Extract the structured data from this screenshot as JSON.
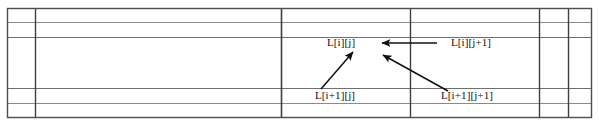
{
  "diagram": {
    "table": {
      "border_color": "#4d4d4d",
      "inner_line_color": "#808080",
      "bounds": {
        "x": 7,
        "y": 8,
        "width": 585,
        "height": 110
      },
      "vertical_lines": [
        7,
        35,
        281,
        410,
        539,
        568,
        592
      ],
      "horizontal_lines": [
        8,
        22,
        37,
        88,
        103,
        118
      ],
      "columns": 6,
      "rows": 5
    },
    "labels": [
      {
        "id": "l-i-j",
        "text": "L[i][j]",
        "x": 327,
        "y": 36
      },
      {
        "id": "l-i-j-plus-1",
        "text": "L[i][j+1]",
        "x": 451,
        "y": 36
      },
      {
        "id": "l-i-plus-1-j",
        "text": "L[i+1][j]",
        "x": 315,
        "y": 89
      },
      {
        "id": "l-i-plus-1-j-plus-1",
        "text": "L[i+1][j+1]",
        "x": 441,
        "y": 89
      }
    ],
    "arrows": [
      {
        "id": "arrow-right-to-left",
        "from_label": "L[i][j+1]",
        "to_label": "L[i][j]",
        "direction": "left",
        "x1": 437,
        "y1": 43,
        "x2": 381,
        "y2": 43
      },
      {
        "id": "arrow-below-to-up-right",
        "from_label": "L[i+1][j]",
        "to_label": "L[i][j]",
        "direction": "up-right",
        "x1": 322,
        "y1": 88,
        "x2": 353,
        "y2": 52
      },
      {
        "id": "arrow-diagonal-to-up-left",
        "from_label": "L[i+1][j+1]",
        "to_label": "L[i][j]",
        "direction": "up-left",
        "x1": 447,
        "y1": 90,
        "x2": 383,
        "y2": 55
      }
    ],
    "colors": {
      "background": "#ffffff",
      "text": "#111111",
      "arrow": "#111111",
      "border": "#4d4d4d",
      "grid": "#808080"
    }
  }
}
